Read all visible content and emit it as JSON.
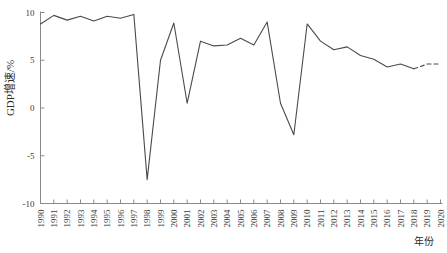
{
  "chart_data": {
    "type": "line",
    "title": "",
    "xlabel": "年份",
    "ylabel": "GDP增速/%",
    "ylim": [
      -10,
      10
    ],
    "yticks": [
      -10,
      -5,
      0,
      5,
      10
    ],
    "yticklabels": [
      "-10",
      "-5",
      "0",
      "5",
      "10"
    ],
    "xlim": [
      1990,
      2020
    ],
    "grid": false,
    "legend": null,
    "x": [
      1990,
      1991,
      1992,
      1993,
      1994,
      1995,
      1996,
      1997,
      1998,
      1999,
      2000,
      2001,
      2002,
      2003,
      2004,
      2005,
      2006,
      2007,
      2008,
      2009,
      2010,
      2011,
      2012,
      2013,
      2014,
      2015,
      2016,
      2017,
      2018,
      2019,
      2020
    ],
    "series": [
      {
        "name": "GDP增速",
        "style": "solid",
        "x": [
          1990,
          1991,
          1992,
          1993,
          1994,
          1995,
          1996,
          1997,
          1998,
          1999,
          2000,
          2001,
          2002,
          2003,
          2004,
          2005,
          2006,
          2007,
          2008,
          2009,
          2010,
          2011,
          2012,
          2013,
          2014,
          2015,
          2016,
          2017,
          2018
        ],
        "values": [
          8.8,
          9.7,
          9.2,
          9.6,
          9.1,
          9.6,
          9.4,
          9.8,
          -7.5,
          5.0,
          8.9,
          0.5,
          7.0,
          6.5,
          6.6,
          7.3,
          6.6,
          9.0,
          0.5,
          -2.8,
          8.8,
          7.0,
          6.1,
          6.4,
          5.5,
          5.1,
          4.3,
          4.6,
          4.1
        ]
      },
      {
        "name": "GDP增速预测",
        "style": "dashed",
        "x": [
          2018,
          2019,
          2020
        ],
        "values": [
          4.1,
          4.6,
          4.6
        ]
      }
    ],
    "annotations": []
  },
  "axes": {
    "y_axis_label": "GDP增速/%",
    "x_axis_label": "年份",
    "x_tick_labels": [
      "1990",
      "1991",
      "1992",
      "1993",
      "1994",
      "1995",
      "1996",
      "1997",
      "1998",
      "1999",
      "2000",
      "2001",
      "2002",
      "2003",
      "2004",
      "2005",
      "2006",
      "2007",
      "2008",
      "2009",
      "2010",
      "2011",
      "2012",
      "2013",
      "2014",
      "2015",
      "2016",
      "2017",
      "2018",
      "2019",
      "2020"
    ],
    "y_tick_labels": [
      "10",
      "5",
      "0",
      "-5",
      "-10"
    ]
  },
  "colors": {
    "line": "#4a4a4a",
    "axis": "#8a8a8a",
    "text": "#2b2b2b",
    "background": "#ffffff"
  }
}
